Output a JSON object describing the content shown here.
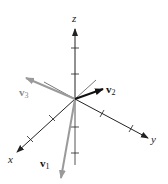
{
  "diagram": {
    "axes": {
      "x": {
        "label": "x"
      },
      "y": {
        "label": "y"
      },
      "z": {
        "label": "z"
      }
    },
    "vectors": [
      {
        "name": "v",
        "subscript": "1",
        "color": "#9a9a9a"
      },
      {
        "name": "v",
        "subscript": "2",
        "color": "#111111"
      },
      {
        "name": "v",
        "subscript": "3",
        "color": "#9a9a9a"
      }
    ],
    "colors": {
      "axis": "#333333",
      "light_vector": "#9a9a9a",
      "dark_vector": "#111111"
    }
  }
}
